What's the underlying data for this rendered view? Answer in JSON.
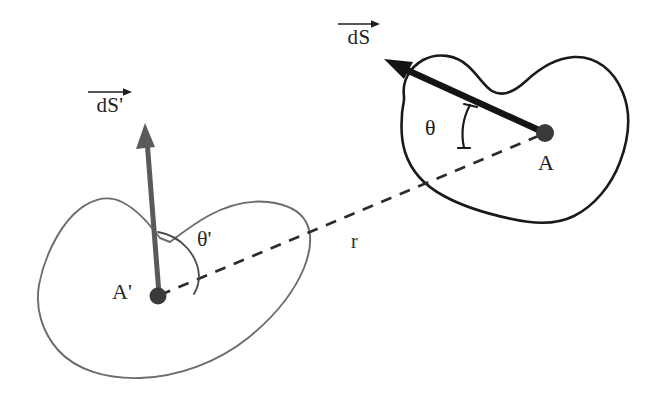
{
  "figure": {
    "background_color": "#ffffff",
    "width": 656,
    "height": 398,
    "colors": {
      "dark_stroke": "#1a1a1a",
      "light_stroke": "#6b6b70",
      "dashed_stroke": "#2b2b2b",
      "point_fill": "#3a3a3a",
      "text": "#2b2b2b"
    },
    "labels": {
      "ds": "dS",
      "ds_prime": "dS'",
      "theta": "θ",
      "theta_prime": "θ'",
      "point_a": "A",
      "point_a_prime": "A'",
      "distance": "r"
    },
    "elements": {
      "surface_right_name": "dS",
      "surface_left_name": "dS'",
      "normal_right": "dS vector",
      "normal_left": "dS' vector",
      "separation_line": "r"
    },
    "geometry": {
      "point_a": {
        "x": 545,
        "y": 133
      },
      "point_a_prime": {
        "x": 158,
        "y": 296
      },
      "normal_right_tip": {
        "x": 386,
        "y": 60
      },
      "normal_left_tip": {
        "x": 145,
        "y": 125
      }
    }
  }
}
